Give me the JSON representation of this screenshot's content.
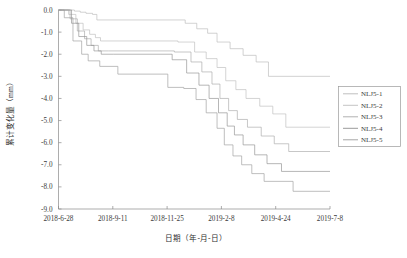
{
  "chart_data": {
    "type": "line",
    "title": "",
    "xlabel": "日期（年-月-日）",
    "ylabel": "累计变化量（mm）",
    "xtick_labels": [
      "2018-6-28",
      "2018-9-11",
      "2018-11-25",
      "2019-2-8",
      "2019-4-24",
      "2019-7-8"
    ],
    "ytick_labels": [
      "0.0",
      "-1.0",
      "-2.0",
      "-3.0",
      "-4.0",
      "-5.0",
      "-6.0",
      "-7.0",
      "-8.0",
      "-9.0"
    ],
    "ylim": [
      -9.0,
      0.0
    ],
    "xlim": [
      "2018-6-28",
      "2019-7-8"
    ],
    "grid": false,
    "legend_position": "right",
    "legend_entries": [
      "NLJ5-1",
      "NLJ5-2",
      "NLJ5-3",
      "NLJ5-4",
      "NLJ5-5"
    ],
    "series": [
      {
        "name": "NLJ5-1",
        "color": "#b9b9b9",
        "x": [
          "2018-6-28",
          "2018-7-8",
          "2018-7-20",
          "2018-7-28",
          "2018-8-5",
          "2018-8-14",
          "2018-8-20",
          "2018-10-2",
          "2018-12-20",
          "2019-1-5",
          "2019-1-20",
          "2019-2-2",
          "2019-2-20",
          "2019-3-10",
          "2019-3-28",
          "2019-4-14",
          "2019-7-8"
        ],
        "y": [
          0.0,
          0.0,
          -0.05,
          -0.1,
          -0.15,
          -0.2,
          -0.45,
          -0.45,
          -0.6,
          -0.85,
          -1.05,
          -1.45,
          -1.75,
          -2.05,
          -2.35,
          -3.0,
          -3.0
        ]
      },
      {
        "name": "NLJ5-2",
        "color": "#bdbdbd",
        "x": [
          "2018-6-28",
          "2018-7-12",
          "2018-7-22",
          "2018-8-1",
          "2018-8-10",
          "2018-8-18",
          "2018-8-25",
          "2018-9-10",
          "2018-12-10",
          "2019-1-2",
          "2019-1-18",
          "2019-2-2",
          "2019-2-14",
          "2019-2-28",
          "2019-3-14",
          "2019-4-2",
          "2019-4-20",
          "2019-5-8",
          "2019-7-8"
        ],
        "y": [
          0.0,
          -0.2,
          -0.6,
          -0.9,
          -1.1,
          -1.25,
          -1.4,
          -1.4,
          -1.45,
          -1.9,
          -2.2,
          -2.6,
          -3.2,
          -3.6,
          -4.0,
          -4.35,
          -4.7,
          -5.3,
          -5.3
        ]
      },
      {
        "name": "NLJ5-3",
        "color": "#a9a9a9",
        "x": [
          "2018-6-28",
          "2018-7-14",
          "2018-7-24",
          "2018-8-3",
          "2018-8-12",
          "2018-8-22",
          "2018-9-5",
          "2018-12-5",
          "2018-12-28",
          "2019-1-12",
          "2019-1-26",
          "2019-2-6",
          "2019-2-18",
          "2019-3-2",
          "2019-3-16",
          "2019-4-4",
          "2019-4-22",
          "2019-5-12",
          "2019-7-8"
        ],
        "y": [
          0.0,
          -0.4,
          -0.95,
          -1.3,
          -1.6,
          -1.85,
          -1.85,
          -1.9,
          -2.35,
          -2.8,
          -3.35,
          -4.0,
          -4.55,
          -4.95,
          -5.3,
          -5.7,
          -6.05,
          -6.4,
          -6.4
        ]
      },
      {
        "name": "NLJ5-4",
        "color": "#8f8f8f",
        "x": [
          "2018-6-28",
          "2018-7-16",
          "2018-7-26",
          "2018-8-6",
          "2018-8-16",
          "2018-8-26",
          "2018-9-12",
          "2018-12-2",
          "2018-12-22",
          "2019-1-8",
          "2019-1-22",
          "2019-2-4",
          "2019-2-16",
          "2019-2-26",
          "2019-3-10",
          "2019-3-26",
          "2019-4-12",
          "2019-5-2",
          "2019-7-8"
        ],
        "y": [
          0.0,
          -0.6,
          -1.2,
          -1.6,
          -1.85,
          -2.0,
          -2.0,
          -2.25,
          -2.85,
          -3.4,
          -4.0,
          -4.65,
          -5.25,
          -5.65,
          -6.1,
          -6.55,
          -6.95,
          -7.3,
          -7.3
        ]
      },
      {
        "name": "NLJ5-5",
        "color": "#9c9c9c",
        "x": [
          "2018-6-28",
          "2018-7-6",
          "2018-7-18",
          "2018-7-30",
          "2018-8-8",
          "2018-8-24",
          "2018-9-18",
          "2018-11-26",
          "2018-12-18",
          "2019-1-4",
          "2019-1-18",
          "2019-2-2",
          "2019-2-12",
          "2019-2-24",
          "2019-3-8",
          "2019-3-22",
          "2019-4-8",
          "2019-5-18",
          "2019-7-8"
        ],
        "y": [
          0.0,
          -0.35,
          -1.4,
          -2.0,
          -2.3,
          -2.55,
          -2.9,
          -3.5,
          -3.55,
          -4.05,
          -4.65,
          -5.35,
          -6.1,
          -6.6,
          -7.0,
          -7.4,
          -7.75,
          -8.2,
          -8.2
        ]
      }
    ]
  },
  "axis": {
    "y_title": "累计变化量（mm）",
    "x_title": "日期（年-月-日）"
  },
  "legend": {
    "items": [
      {
        "label": "NLJ5-1"
      },
      {
        "label": "NLJ5-2"
      },
      {
        "label": "NLJ5-3"
      },
      {
        "label": "NLJ5-4"
      },
      {
        "label": "NLJ5-5"
      }
    ]
  }
}
